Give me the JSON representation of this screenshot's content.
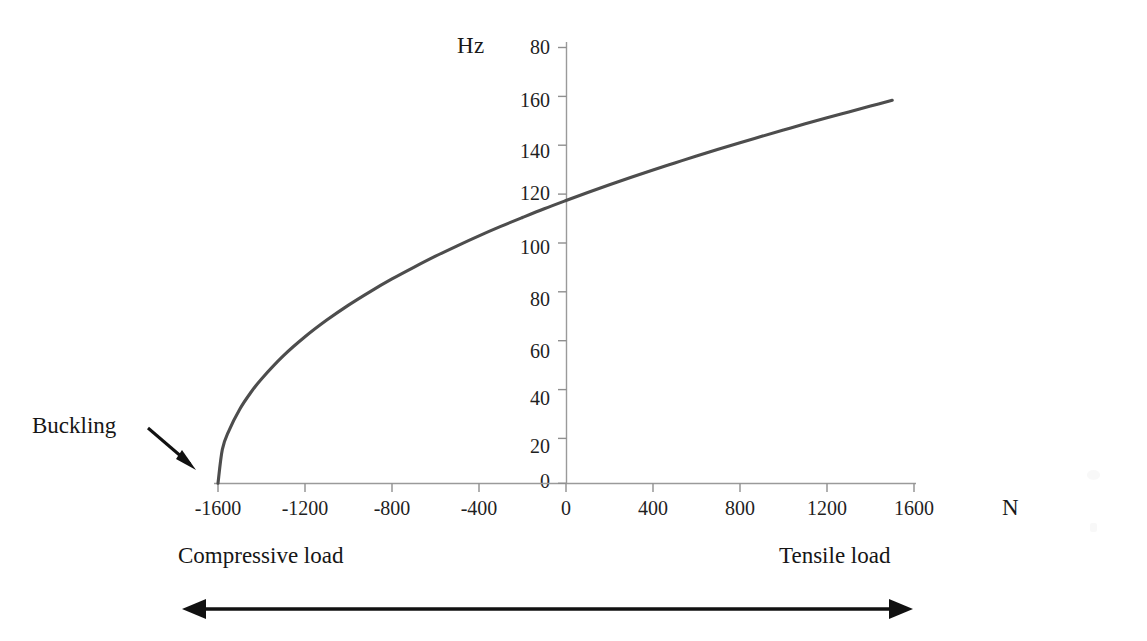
{
  "chart_data": {
    "type": "line",
    "title": "",
    "xlabel": "N",
    "ylabel": "Hz",
    "x_unit_label": "N",
    "y_unit_label": "Hz",
    "xlim": [
      -1700,
      1600
    ],
    "ylim": [
      0,
      180
    ],
    "x_ticks": [
      -1600,
      -1200,
      -800,
      -400,
      0,
      400,
      800,
      1200,
      1600
    ],
    "x_tick_labels": [
      "-1600",
      "-1200",
      "-800",
      "-400",
      "0",
      "400",
      "800",
      "1200",
      "1600"
    ],
    "y_ticks": [
      0,
      20,
      40,
      60,
      80,
      100,
      120,
      140,
      160,
      180
    ],
    "y_tick_labels": [
      "0",
      "20",
      "40",
      "60",
      "80",
      "100",
      "120",
      "140",
      "160",
      "80"
    ],
    "grid": false,
    "legend": null,
    "series": [
      {
        "name": "Natural frequency vs axial load",
        "color": "#4d4d4d",
        "x": [
          -1600,
          -1580,
          -1550,
          -1500,
          -1450,
          -1400,
          -1300,
          -1200,
          -1100,
          -1000,
          -900,
          -800,
          -700,
          -600,
          -500,
          -400,
          -300,
          -200,
          -100,
          0,
          100,
          200,
          300,
          400,
          500,
          600,
          700,
          800,
          900,
          1000,
          1100,
          1200,
          1300,
          1400,
          1500
        ],
        "y": [
          0,
          14.0,
          21.7,
          30.6,
          37.4,
          43.1,
          52.6,
          60.5,
          67.4,
          73.6,
          79.2,
          84.4,
          89.2,
          93.8,
          98.1,
          102.2,
          106.1,
          109.8,
          113.4,
          116.8,
          120.1,
          123.3,
          126.4,
          129.4,
          132.3,
          135.2,
          138.0,
          140.7,
          143.3,
          145.9,
          148.5,
          151.0,
          153.4,
          155.8,
          158.2
        ]
      }
    ],
    "annotations": [
      {
        "name": "buckling",
        "text": "Buckling",
        "points_to_x": -1600,
        "points_to_y": 0
      },
      {
        "name": "compressive-load",
        "text": "Compressive load"
      },
      {
        "name": "tensile-load",
        "text": "Tensile load"
      }
    ],
    "load_direction_arrow": {
      "left_label": "Compressive load",
      "right_label": "Tensile load",
      "double_headed": true
    }
  },
  "axis": {
    "y_unit": "Hz",
    "x_unit": "N"
  },
  "y_tick_labels": [
    {
      "text": "80",
      "top": 36
    },
    {
      "text": "160",
      "top": 89
    },
    {
      "text": "140",
      "top": 140
    },
    {
      "text": "120",
      "top": 182
    },
    {
      "text": "100",
      "top": 236
    },
    {
      "text": "80",
      "top": 288
    },
    {
      "text": "60",
      "top": 340
    },
    {
      "text": "40",
      "top": 387
    },
    {
      "text": "20",
      "top": 435
    },
    {
      "text": "0",
      "top": 470
    }
  ],
  "x_tick_labels": [
    {
      "text": "-1600",
      "left": 183
    },
    {
      "text": "-1200",
      "left": 270
    },
    {
      "text": "-800",
      "left": 357
    },
    {
      "text": "-400",
      "left": 444
    },
    {
      "text": "0",
      "left": 531
    },
    {
      "text": "400",
      "left": 618
    },
    {
      "text": "800",
      "left": 705
    },
    {
      "text": "1200",
      "left": 792
    },
    {
      "text": "1600",
      "left": 879
    }
  ],
  "annotations": {
    "buckling": "Buckling",
    "compressive_load": "Compressive load",
    "tensile_load": "Tensile load"
  },
  "colors": {
    "curve": "#4d4d4d",
    "axis": "#9a9a9a",
    "text": "#1a1a1a",
    "arrow": "#111111",
    "background": "#ffffff"
  }
}
